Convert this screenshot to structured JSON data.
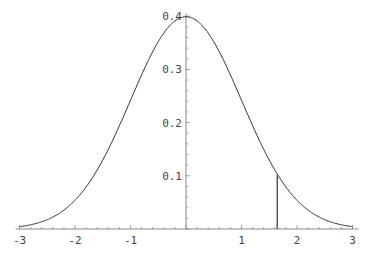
{
  "chart_data": {
    "type": "line",
    "title": "",
    "xlabel": "",
    "ylabel": "",
    "xlim": [
      -3,
      3
    ],
    "ylim": [
      0,
      0.4
    ],
    "grid": false,
    "series": [
      {
        "name": "standard normal density",
        "function": "exp(-x^2/2)/sqrt(2*pi)",
        "x_range": [
          -3,
          3
        ]
      }
    ],
    "annotations": [
      {
        "type": "vertical_line",
        "x": 1.645,
        "y_from": 0,
        "y_to": 0.103
      }
    ],
    "x_ticks": [
      {
        "value": -3,
        "label": "-3"
      },
      {
        "value": -2,
        "label": "-2"
      },
      {
        "value": -1,
        "label": "-1"
      },
      {
        "value": 1,
        "label": "1"
      },
      {
        "value": 2,
        "label": "2"
      },
      {
        "value": 3,
        "label": "3"
      }
    ],
    "y_ticks": [
      {
        "value": 0.1,
        "label": "0.1"
      },
      {
        "value": 0.2,
        "label": "0.2"
      },
      {
        "value": 0.3,
        "label": "0.3"
      },
      {
        "value": 0.4,
        "label": "0.4"
      }
    ],
    "colors": {
      "curve": "#333333",
      "axis": "#888888",
      "marker_line": "#555555"
    }
  }
}
